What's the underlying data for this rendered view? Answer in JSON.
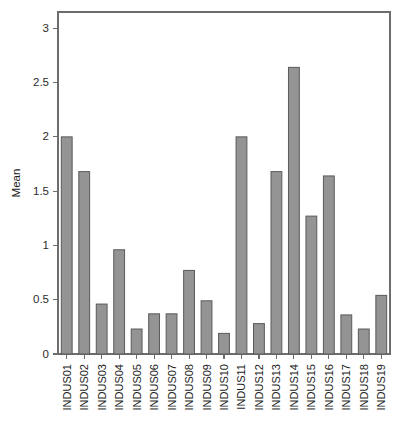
{
  "chart_data": {
    "type": "bar",
    "title": "",
    "subtitle": "",
    "xlabel": "",
    "ylabel": "Mean",
    "ylim": [
      0,
      3.15
    ],
    "yticks": [
      0,
      0.5,
      1,
      1.5,
      2,
      2.5,
      3
    ],
    "ytick_labels": [
      "0",
      "0.5",
      "1",
      "1.5",
      "2",
      "2.5",
      "3"
    ],
    "grid": false,
    "legend": null,
    "bar_color": "#949494",
    "bar_edge_color": "#5a5a5a",
    "axis_color": "#6d6d6d",
    "categories": [
      "INDUS01",
      "INDUS02",
      "INDUS03",
      "INDUS04",
      "INDUS05",
      "INDUS06",
      "INDUS07",
      "INDUS08",
      "INDUS09",
      "INDUS10",
      "INDUS11",
      "INDUS12",
      "INDUS13",
      "INDUS14",
      "INDUS15",
      "INDUS16",
      "INDUS17",
      "INDUS18",
      "INDUS19"
    ],
    "values": [
      2.0,
      1.68,
      0.46,
      0.96,
      0.23,
      0.37,
      0.37,
      0.77,
      0.49,
      0.19,
      2.0,
      0.28,
      1.68,
      2.64,
      1.27,
      1.64,
      0.36,
      0.23,
      0.54
    ]
  },
  "plot_geometry": {
    "left": 58,
    "right": 390,
    "top": 12,
    "bottom": 354,
    "bar_width_ratio": 0.62
  }
}
